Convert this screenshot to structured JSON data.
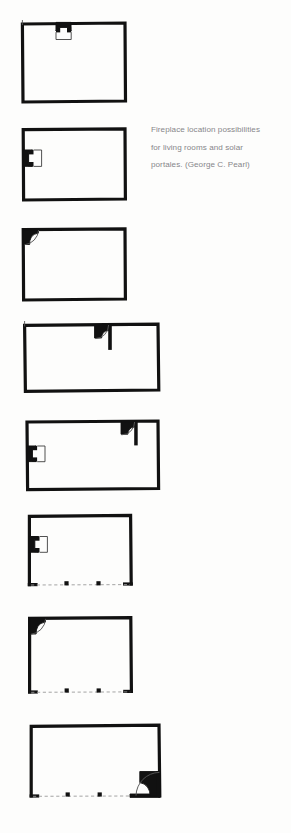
{
  "document": {
    "type": "architectural-figure",
    "background_color": "#fdfdfc",
    "ink_color": "#111111",
    "caption_color": "#87868a"
  },
  "caption": {
    "text": "Fireplace location possibilities for living rooms and solar portales. (George C. Pearl)",
    "line1": "Fireplace location possibilities",
    "line2": "for living rooms and solar",
    "line3": "portales. (George C. Pearl)"
  },
  "figure": {
    "title": "Fireplace location possibilities",
    "subject": "living rooms and solar portales",
    "credit": "George C. Pearl",
    "plan_count": 8
  },
  "plans": [
    {
      "id": "plan-1",
      "name": "enclosed-room-fireplace-top-center",
      "enclosure": "enclosed",
      "room_shape": "rectangle",
      "fireplace": "top-wall-center",
      "has_portal": false,
      "has_arc": false,
      "posts": 0,
      "x": 20,
      "y": 22,
      "w": 105,
      "h": 80
    },
    {
      "id": "plan-2",
      "name": "enclosed-room-fireplace-left-wall",
      "enclosure": "enclosed",
      "room_shape": "rectangle",
      "fireplace": "left-wall-center",
      "has_portal": false,
      "has_arc": false,
      "posts": 0,
      "x": 22,
      "y": 128,
      "w": 103,
      "h": 70
    },
    {
      "id": "plan-3",
      "name": "enclosed-room-fireplace-corner-top-left",
      "enclosure": "enclosed",
      "room_shape": "rectangle",
      "fireplace": "top-left-corner",
      "has_portal": false,
      "has_arc": true,
      "posts": 0,
      "x": 22,
      "y": 228,
      "w": 103,
      "h": 70
    },
    {
      "id": "plan-4",
      "name": "enclosed-room-fireplace-interior-partition",
      "enclosure": "enclosed",
      "room_shape": "wide-rectangle",
      "fireplace": "interior-partition-top",
      "has_portal": false,
      "has_arc": true,
      "posts": 0,
      "x": 24,
      "y": 324,
      "w": 134,
      "h": 66
    },
    {
      "id": "plan-5",
      "name": "enclosed-room-fireplace-left-and-partition",
      "enclosure": "enclosed",
      "room_shape": "wide-rectangle",
      "fireplace": "left-wall-and-interior-partition",
      "has_portal": false,
      "has_arc": true,
      "posts": 0,
      "x": 26,
      "y": 420,
      "w": 131,
      "h": 66
    },
    {
      "id": "plan-6",
      "name": "portal-fireplace-left-wall",
      "enclosure": "open-portal",
      "room_shape": "rectangle",
      "fireplace": "left-wall-center",
      "has_portal": true,
      "has_arc": false,
      "posts": 2,
      "x": 28,
      "y": 515,
      "w": 102,
      "h": 68
    },
    {
      "id": "plan-7",
      "name": "portal-fireplace-corner-top-left",
      "enclosure": "open-portal",
      "room_shape": "rectangle",
      "fireplace": "top-left-corner",
      "has_portal": true,
      "has_arc": true,
      "posts": 2,
      "x": 28,
      "y": 616,
      "w": 102,
      "h": 74
    },
    {
      "id": "plan-8",
      "name": "portal-fireplace-corner-bottom-right",
      "enclosure": "open-portal",
      "room_shape": "wide-rectangle",
      "fireplace": "bottom-right-corner",
      "has_portal": true,
      "has_arc": true,
      "posts": 2,
      "x": 30,
      "y": 722,
      "w": 130,
      "h": 72
    }
  ]
}
